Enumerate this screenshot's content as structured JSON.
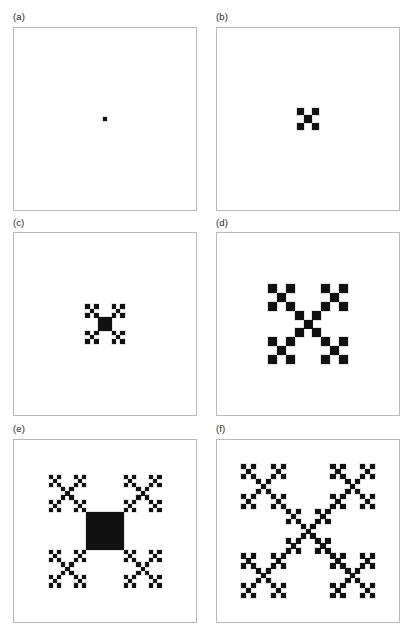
{
  "figure": {
    "type": "fractal-growth-panel-series",
    "background_color": "#ffffff",
    "ink_color": "#111111",
    "border_color": "#b9b9b9",
    "label_color": "#1c1c1c",
    "width": 413,
    "height": 632,
    "columns": 2,
    "rows": 3
  },
  "panels": [
    {
      "id": "a",
      "label": "(a)",
      "label_x": 13,
      "label_y": 12,
      "box_x": 13,
      "box_y": 27,
      "box_w": 184,
      "box_h": 184,
      "pattern": "seed-dot",
      "iteration": 0,
      "generator": "quincunx",
      "cells": 1,
      "fractal_span": 3,
      "render_span": 3,
      "center_x": 0.5,
      "center_y": 0.5,
      "scale": 0.021
    },
    {
      "id": "b",
      "label": "(b)",
      "label_x": 216,
      "label_y": 12,
      "box_x": 216,
      "box_y": 27,
      "box_w": 184,
      "box_h": 184,
      "pattern": "quincunx-fractal",
      "iteration": 1,
      "generator": "quincunx",
      "cells": 5,
      "fractal_span": 3,
      "render_span": 3,
      "center_x": 0.5,
      "center_y": 0.5,
      "scale": 0.125
    },
    {
      "id": "c",
      "label": "(c)",
      "label_x": 13,
      "label_y": 218,
      "box_x": 13,
      "box_y": 232,
      "box_w": 184,
      "box_h": 184,
      "pattern": "filled-square-with-corner-seeds",
      "iteration": 1,
      "generator": "square-plus-corners",
      "cells": 5,
      "fractal_span": 9,
      "render_span": 9,
      "center_x": 0.5,
      "center_y": 0.5,
      "scale": 0.215
    },
    {
      "id": "d",
      "label": "(d)",
      "label_x": 216,
      "label_y": 218,
      "box_x": 216,
      "box_y": 232,
      "box_w": 184,
      "box_h": 184,
      "pattern": "quincunx-fractal",
      "iteration": 2,
      "generator": "quincunx",
      "cells": 25,
      "fractal_span": 9,
      "render_span": 9,
      "center_x": 0.5,
      "center_y": 0.5,
      "scale": 0.44
    },
    {
      "id": "e",
      "label": "(e)",
      "label_x": 13,
      "label_y": 424,
      "box_x": 13,
      "box_y": 439,
      "box_w": 184,
      "box_h": 184,
      "pattern": "filled-square-with-corner-quincunx",
      "iteration": 2,
      "generator": "square-plus-corners",
      "cells": 25,
      "fractal_span": 27,
      "render_span": 27,
      "center_x": 0.5,
      "center_y": 0.5,
      "scale": 0.62
    },
    {
      "id": "f",
      "label": "(f)",
      "label_x": 216,
      "label_y": 424,
      "box_x": 216,
      "box_y": 439,
      "box_w": 184,
      "box_h": 184,
      "pattern": "quincunx-fractal",
      "iteration": 3,
      "generator": "quincunx",
      "cells": 125,
      "fractal_span": 27,
      "render_span": 27,
      "center_x": 0.5,
      "center_y": 0.5,
      "scale": 0.74
    }
  ]
}
